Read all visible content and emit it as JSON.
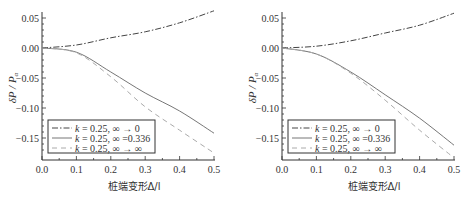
{
  "chart_data": [
    {
      "type": "line",
      "title": "",
      "xlabel": "桩端变形Δ/l",
      "ylabel": "δP / Pα",
      "xlim": [
        0.0,
        0.5
      ],
      "ylim": [
        -0.186,
        0.058
      ],
      "x_ticks": [
        "0.0",
        "0.1",
        "0.2",
        "0.3",
        "0.4",
        "0.5"
      ],
      "y_ticks": [
        "0.05",
        "0.00",
        "-0.05",
        "-0.10",
        "-0.15"
      ],
      "grid": false,
      "legend_position": "lower-left",
      "x": [
        0.0,
        0.1,
        0.2,
        0.3,
        0.4,
        0.5
      ],
      "series": [
        {
          "name": "k = 0.25, ∞ → 0",
          "style": "dash-dot",
          "values": [
            0.0,
            0.005,
            0.017,
            0.027,
            0.042,
            0.062
          ]
        },
        {
          "name": "k = 0.25, ∞ = 0.336",
          "style": "solid",
          "values": [
            0.0,
            -0.007,
            -0.04,
            -0.075,
            -0.105,
            -0.142
          ]
        },
        {
          "name": "k = 0.25, ∞ → ∞",
          "style": "dashed",
          "values": [
            0.0,
            -0.008,
            -0.048,
            -0.098,
            -0.137,
            -0.175
          ]
        }
      ]
    },
    {
      "type": "line",
      "title": "",
      "xlabel": "桩端变形Δ/l",
      "ylabel": "δP / Pα",
      "xlim": [
        0.0,
        0.5
      ],
      "ylim": [
        -0.186,
        0.058
      ],
      "x_ticks": [
        "0.0",
        "0.1",
        "0.2",
        "0.3",
        "0.4",
        "0.5"
      ],
      "y_ticks": [
        "0.05",
        "0.00",
        "-0.05",
        "-0.10",
        "-0.15"
      ],
      "grid": false,
      "legend_position": "lower-left",
      "x": [
        0.0,
        0.1,
        0.2,
        0.3,
        0.4,
        0.5
      ],
      "series": [
        {
          "name": "k = 0.25, ∞ → 0",
          "style": "dash-dot",
          "values": [
            0.0,
            0.003,
            0.012,
            0.025,
            0.038,
            0.058
          ]
        },
        {
          "name": "k = 0.25, ∞ = 0.336",
          "style": "solid",
          "values": [
            0.0,
            -0.01,
            -0.04,
            -0.078,
            -0.117,
            -0.162
          ]
        },
        {
          "name": "k = 0.25, ∞ → ∞",
          "style": "dashed",
          "values": [
            0.0,
            -0.01,
            -0.042,
            -0.087,
            -0.137,
            -0.183
          ]
        }
      ]
    }
  ],
  "charts": [
    {
      "ylabel_main": "δP / P",
      "ylabel_sub": "α",
      "xlabel": "桩端变形Δ/l",
      "legend": [
        {
          "k_label": "k",
          "text": " = 0.25,  ∞ → 0"
        },
        {
          "k_label": "k",
          "text": " = 0.25,  ∞ =0.336"
        },
        {
          "k_label": "k",
          "text": " = 0.25,  ∞ → ∞"
        }
      ]
    },
    {
      "ylabel_main": "δP / P",
      "ylabel_sub": "α",
      "xlabel": "桩端变形Δ/l",
      "legend": [
        {
          "k_label": "k",
          "text": " = 0.25,  ∞ → 0"
        },
        {
          "k_label": "k",
          "text": " = 0.25,  ∞ =0.336"
        },
        {
          "k_label": "k",
          "text": " = 0.25,  ∞ → ∞"
        }
      ]
    }
  ],
  "colors": {
    "axis": "#333333",
    "dash_dot": "#444444",
    "solid": "#666666",
    "dashed": "#aaaaaa",
    "legend_border": "#333333"
  }
}
